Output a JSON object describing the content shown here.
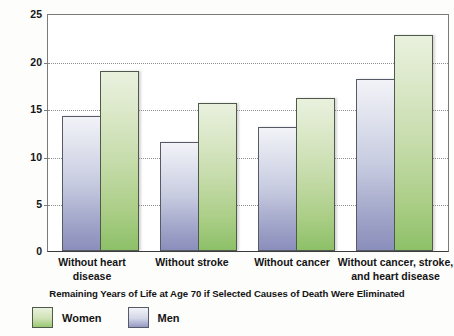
{
  "chart_data": {
    "type": "bar",
    "title": "",
    "xlabel": "Remaining Years of Life at Age 70 if Selected Causes of Death Were Eliminated",
    "ylabel": "Years",
    "ylim": [
      0,
      25
    ],
    "yticks": [
      0,
      5,
      10,
      15,
      20,
      25
    ],
    "ytick_labels": [
      "0",
      "5",
      "10",
      "15",
      "20",
      "25"
    ],
    "grid": "horizontal-dotted",
    "legend_position": "bottom-left",
    "categories": [
      "Without heart disease",
      "Without stroke",
      "Without cancer",
      "Without cancer, stroke, and heart disease"
    ],
    "series": [
      {
        "name": "Men",
        "color": "#9599c4",
        "values": [
          14.2,
          11.5,
          13.0,
          18.1
        ]
      },
      {
        "name": "Women",
        "color": "#9ac873",
        "values": [
          18.9,
          15.5,
          16.1,
          22.7
        ]
      }
    ]
  },
  "axis": {
    "y_label": "Years",
    "x_title": "Remaining Years of Life at Age 70 if Selected Causes of Death Were Eliminated",
    "ticks": [
      {
        "value": "25"
      },
      {
        "value": "20"
      },
      {
        "value": "15"
      },
      {
        "value": "10"
      },
      {
        "value": "5"
      },
      {
        "value": "0"
      }
    ]
  },
  "categories": [
    {
      "line1": "Without heart",
      "line2": "disease"
    },
    {
      "line1": "Without stroke",
      "line2": ""
    },
    {
      "line1": "Without cancer",
      "line2": ""
    },
    {
      "line1": "Without cancer, stroke,",
      "line2": "and heart disease"
    }
  ],
  "legend": {
    "items": [
      {
        "label": "Women",
        "color": "#9ac873"
      },
      {
        "label": "Men",
        "color": "#9599c4"
      }
    ]
  }
}
